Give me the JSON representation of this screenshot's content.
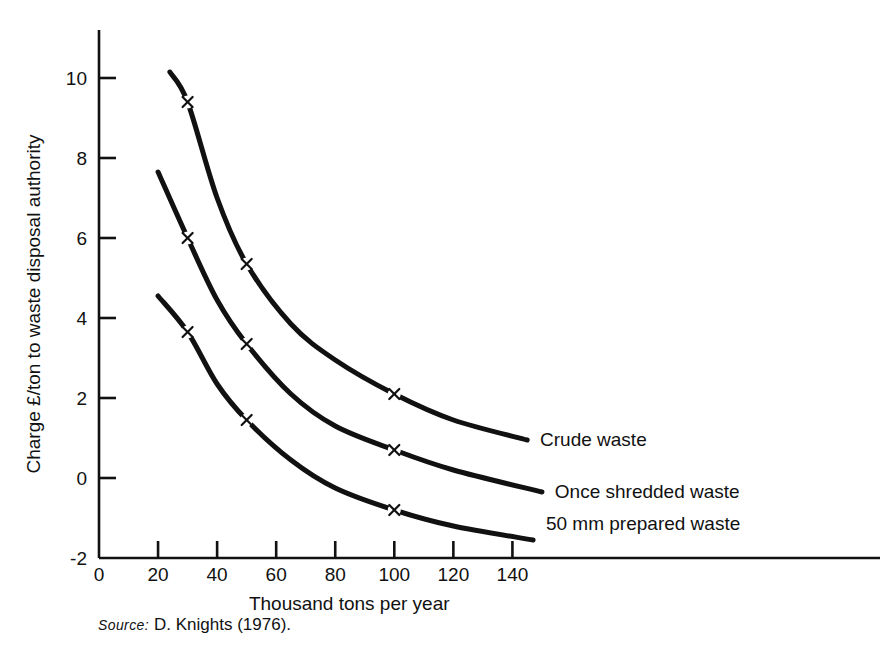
{
  "chart_data": {
    "type": "line",
    "title": "",
    "xlabel": "Thousand tons per year",
    "ylabel": "Charge £/ton to waste disposal authority",
    "xlim": [
      0,
      160
    ],
    "ylim": [
      -2,
      10
    ],
    "xticks": [
      0,
      20,
      40,
      60,
      80,
      100,
      120,
      140
    ],
    "xtick_labels": [
      "0",
      "20",
      "40",
      "60",
      "80",
      "100",
      "120",
      "140"
    ],
    "yticks": [
      -2,
      0,
      2,
      4,
      6,
      8,
      10
    ],
    "ytick_labels": [
      "-2",
      "0",
      "2",
      "4",
      "6",
      "8",
      "10"
    ],
    "grid": false,
    "legend_position": "right-inline-labels",
    "marker": "x",
    "series": [
      {
        "name": "Crude waste",
        "label": "Crude waste",
        "color": "#111111",
        "x": [
          24,
          30,
          40,
          50,
          65,
          80,
          100,
          120,
          145
        ],
        "y": [
          10.15,
          9.4,
          7.0,
          5.35,
          3.85,
          2.95,
          2.1,
          1.45,
          0.95
        ],
        "markers_x": [
          30,
          50,
          100
        ],
        "markers_y": [
          9.4,
          5.35,
          2.1
        ],
        "label_x": 148,
        "label_y": 0.95
      },
      {
        "name": "Once shredded waste",
        "label": "Once shredded waste",
        "color": "#111111",
        "x": [
          20,
          30,
          40,
          50,
          65,
          80,
          100,
          120,
          150
        ],
        "y": [
          7.65,
          6.0,
          4.45,
          3.35,
          2.1,
          1.3,
          0.7,
          0.2,
          -0.35
        ],
        "markers_x": [
          30,
          50,
          100
        ],
        "markers_y": [
          6.0,
          3.35,
          0.7
        ],
        "label_x": 153,
        "label_y": -0.35
      },
      {
        "name": "50 mm prepared waste",
        "label": "50 mm prepared waste",
        "color": "#111111",
        "x": [
          20,
          30,
          40,
          50,
          65,
          80,
          100,
          120,
          147
        ],
        "y": [
          4.55,
          3.65,
          2.35,
          1.45,
          0.45,
          -0.25,
          -0.8,
          -1.2,
          -1.55
        ],
        "markers_x": [
          30,
          50,
          100
        ],
        "markers_y": [
          3.65,
          1.45,
          -0.8
        ],
        "label_x": 150,
        "label_y": -1.15
      }
    ]
  },
  "caption": {
    "source_word": "Source:",
    "source_text": "D. Knights (1976)."
  },
  "colors": {
    "ink": "#111111",
    "background": "#ffffff"
  }
}
